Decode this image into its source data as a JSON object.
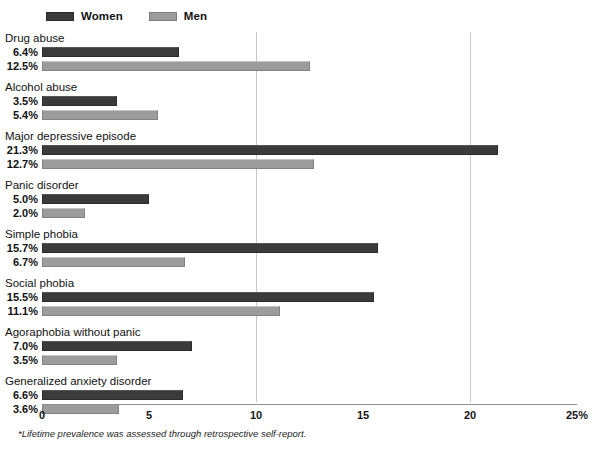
{
  "legend": {
    "entries": [
      {
        "label": "Women",
        "color": "#3b3b3b",
        "key": "women"
      },
      {
        "label": "Men",
        "color": "#9b9b9b",
        "key": "men"
      }
    ]
  },
  "footnote": "*Lifetime prevalence was assessed through retrospective self-report.",
  "axis": {
    "ticks": [
      {
        "value": 0,
        "label": "0"
      },
      {
        "value": 5,
        "label": "5"
      },
      {
        "value": 10,
        "label": "10"
      },
      {
        "value": 15,
        "label": "15"
      },
      {
        "value": 20,
        "label": "20"
      },
      {
        "value": 25,
        "label": "25%"
      }
    ],
    "gridline_values": [
      10,
      20
    ]
  },
  "groups": [
    {
      "title": "Drug abuse",
      "women": {
        "label": "6.4%",
        "value": 6.4
      },
      "men": {
        "label": "12.5%",
        "value": 12.5
      }
    },
    {
      "title": "Alcohol abuse",
      "women": {
        "label": "3.5%",
        "value": 3.5
      },
      "men": {
        "label": "5.4%",
        "value": 5.4
      }
    },
    {
      "title": "Major depressive episode",
      "women": {
        "label": "21.3%",
        "value": 21.3
      },
      "men": {
        "label": "12.7%",
        "value": 12.7
      }
    },
    {
      "title": "Panic disorder",
      "women": {
        "label": "5.0%",
        "value": 5.0
      },
      "men": {
        "label": "2.0%",
        "value": 2.0
      }
    },
    {
      "title": "Simple phobia",
      "women": {
        "label": "15.7%",
        "value": 15.7
      },
      "men": {
        "label": "6.7%",
        "value": 6.7
      }
    },
    {
      "title": "Social phobia",
      "women": {
        "label": "15.5%",
        "value": 15.5
      },
      "men": {
        "label": "11.1%",
        "value": 11.1
      }
    },
    {
      "title": "Agoraphobia without panic",
      "women": {
        "label": "7.0%",
        "value": 7.0
      },
      "men": {
        "label": "3.5%",
        "value": 3.5
      }
    },
    {
      "title": "Generalized anxiety disorder",
      "women": {
        "label": "6.6%",
        "value": 6.6
      },
      "men": {
        "label": "3.6%",
        "value": 3.6
      }
    }
  ],
  "chart_data": {
    "type": "bar",
    "orientation": "horizontal",
    "title": "",
    "subtitle": "",
    "xlabel": "",
    "ylabel": "",
    "xlim": [
      0,
      25
    ],
    "xticks": [
      0,
      5,
      10,
      15,
      20,
      25
    ],
    "xticklabels": [
      "0",
      "5",
      "10",
      "15",
      "20",
      "25%"
    ],
    "grid": "vertical-gridlines-at-10-and-20",
    "legend_position": "top-left",
    "annotations": [
      "*Lifetime prevalence was assessed through retrospective self-report."
    ],
    "categories": [
      "Drug abuse",
      "Alcohol abuse",
      "Major depressive episode",
      "Panic disorder",
      "Simple phobia",
      "Social phobia",
      "Agoraphobia without panic",
      "Generalized anxiety disorder"
    ],
    "series": [
      {
        "name": "Women",
        "color": "#3b3b3b",
        "values": [
          6.4,
          3.5,
          21.3,
          5.0,
          15.7,
          15.5,
          7.0,
          6.6
        ],
        "data_labels": [
          "6.4%",
          "3.5%",
          "21.3%",
          "5.0%",
          "15.7%",
          "15.5%",
          "7.0%",
          "6.6%"
        ]
      },
      {
        "name": "Men",
        "color": "#9b9b9b",
        "values": [
          12.5,
          5.4,
          12.7,
          2.0,
          6.7,
          11.1,
          3.5,
          3.6
        ],
        "data_labels": [
          "12.5%",
          "5.4%",
          "12.7%",
          "2.0%",
          "6.7%",
          "11.1%",
          "3.5%",
          "3.6%"
        ]
      }
    ]
  }
}
